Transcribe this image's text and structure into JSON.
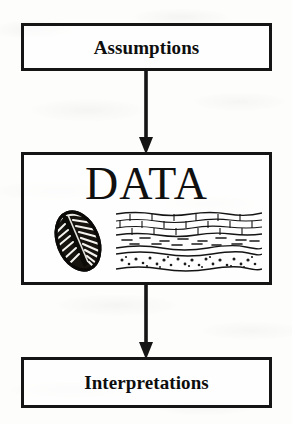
{
  "diagram": {
    "type": "flowchart",
    "orientation": "vertical",
    "background_color": "#fdfdfc",
    "stroke_color": "#151515",
    "nodes": [
      {
        "id": "assumptions",
        "label": "Assumptions",
        "shape": "rectangle",
        "order": 1
      },
      {
        "id": "data",
        "label": "DATA",
        "shape": "rectangle",
        "order": 2,
        "illustrations": [
          {
            "name": "fossil-illustration",
            "subject": "trilobite fossil",
            "description": "oval segmented fossil shell with radiating ribs, dark ink line drawing"
          },
          {
            "name": "strata-illustration",
            "subject": "geologic strata cross-section",
            "layers": [
              {
                "name": "limestone-layer",
                "pattern": "brick"
              },
              {
                "name": "shale-layer",
                "pattern": "dashes"
              },
              {
                "name": "conglomerate-layer",
                "pattern": "dots"
              }
            ]
          }
        ]
      },
      {
        "id": "interpretations",
        "label": "Interpretations",
        "shape": "rectangle",
        "order": 3
      }
    ],
    "edges": [
      {
        "id": "assumptions-to-data",
        "from": "Assumptions",
        "to": "DATA",
        "style": "solid",
        "arrowhead": "filled-triangle",
        "direction": "down"
      },
      {
        "id": "data-to-interpretations",
        "from": "DATA",
        "to": "Interpretations",
        "style": "solid",
        "arrowhead": "filled-triangle",
        "direction": "down"
      }
    ]
  }
}
